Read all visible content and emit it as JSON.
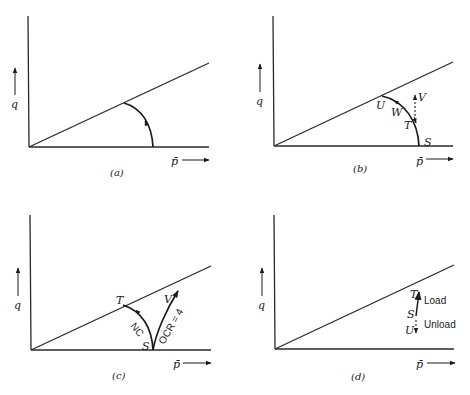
{
  "figure": {
    "panels": [
      {
        "id": "a",
        "caption": "(a)",
        "y_axis_label": "q",
        "x_axis_label": "p̄",
        "labels": []
      },
      {
        "id": "b",
        "caption": "(b)",
        "y_axis_label": "q",
        "x_axis_label": "p̄",
        "labels": [
          "U",
          "W",
          "V",
          "T",
          "S"
        ]
      },
      {
        "id": "c",
        "caption": "(c)",
        "y_axis_label": "q",
        "x_axis_label": "p̄",
        "labels": [
          "T",
          "V",
          "NC",
          "OCR = 4",
          "S"
        ]
      },
      {
        "id": "d",
        "caption": "(d)",
        "y_axis_label": "q",
        "x_axis_label": "p̄",
        "labels": [
          "T",
          "Load",
          "S",
          "Unload",
          "U"
        ]
      }
    ]
  }
}
